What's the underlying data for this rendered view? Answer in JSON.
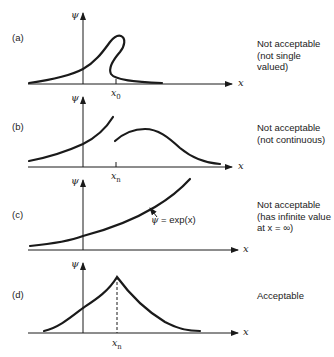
{
  "figure": {
    "axis_symbols": {
      "y": "ψ",
      "x": "x"
    },
    "panels": [
      {
        "id": "a",
        "letter": "(a)",
        "tick_label_base": "x",
        "tick_label_sub": "0",
        "verdict_line1": "Not acceptable",
        "verdict_line2": "(not single valued)",
        "acceptable": false
      },
      {
        "id": "b",
        "letter": "(b)",
        "tick_label_base": "x",
        "tick_label_sub": "n",
        "verdict_line1": "Not acceptable",
        "verdict_line2": "(not continuous)",
        "acceptable": false
      },
      {
        "id": "c",
        "letter": "(c)",
        "curve_annotation_lhs": "ψ",
        "curve_annotation_rhs": " = exp(x)",
        "verdict_line1": "Not acceptable",
        "verdict_line2": "(has infinite value",
        "verdict_line3": "at x = ∞)",
        "acceptable": false
      },
      {
        "id": "d",
        "letter": "(d)",
        "tick_label_base": "x",
        "tick_label_sub": "n",
        "verdict_line1": "Acceptable",
        "acceptable": true
      }
    ],
    "colors": {
      "ink": "#1a1a1a",
      "background": "#ffffff"
    }
  }
}
